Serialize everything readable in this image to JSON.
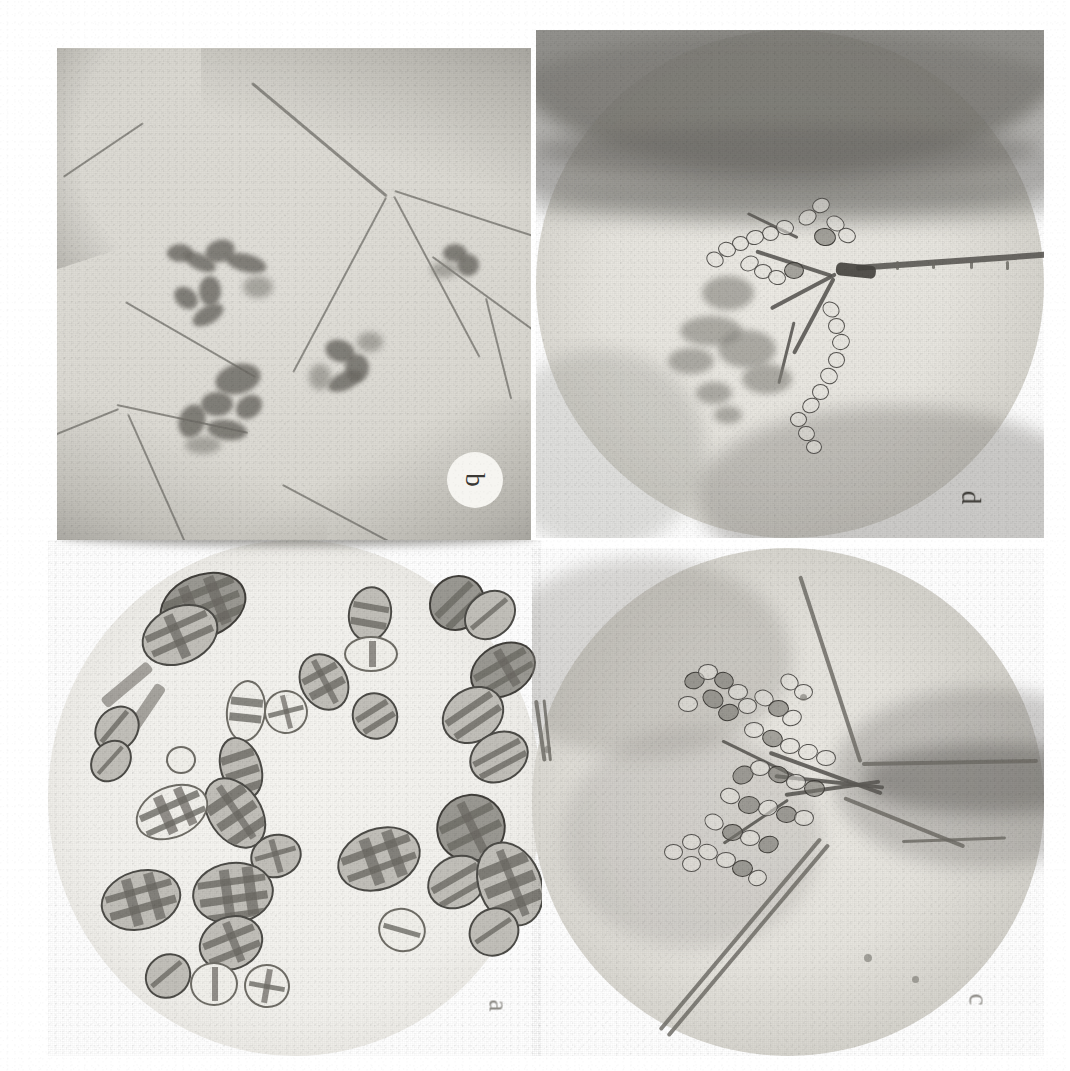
{
  "figure": {
    "background_color": "#ffffff",
    "width": 1070,
    "height": 1071,
    "rendering": "grayscale halftone scan from printed page",
    "label_rotation_degrees": 90,
    "panel_order_on_page": [
      "b",
      "d",
      "a",
      "c"
    ]
  },
  "panels": [
    {
      "id": "panel-b",
      "label": "b",
      "position": "top-left",
      "field_shape": "rectangular crop",
      "subject": "Dark fungal colonies (conidiophore tufts) on the leaf surface with epidermal cell walls and veins visible",
      "label_style": "dark letter inside a white circular disc",
      "dominant_tone": "#dcdad3"
    },
    {
      "id": "panel-d",
      "label": "d",
      "position": "top-right",
      "field_shape": "circular microscope field",
      "subject": "Conidiophore bearing branched acropetal chains of conidia, with out-of-focus dark plant tissue bands across the upper field",
      "label_style": "dark letter on the pale field",
      "dominant_tone": "#e7e5df"
    },
    {
      "id": "panel-a",
      "label": "a",
      "position": "bottom-left",
      "field_shape": "circular microscope field",
      "subject": "Muriform (dictyosporous) conidia with transverse and longitudinal septa, some still attached in short chains on conidiophores",
      "label_style": "faint grey letter on the pale field",
      "dominant_tone": "#f3f2ee"
    },
    {
      "id": "panel-c",
      "label": "c",
      "position": "bottom-right",
      "field_shape": "circular microscope field",
      "subject": "Conidiophore emerging from a hypha on plant tissue, bearing dense branched chains of small conidia",
      "label_style": "faint grey letter on the pale field",
      "dominant_tone": "#e6e4de"
    }
  ],
  "colors": {
    "page": "#ffffff",
    "ink_dark": "#3a3834",
    "ink_faint": "#8d8b86",
    "field_light": "#f3f2ee",
    "field_mid": "#dcdad3",
    "field_dark": "#a6a49d",
    "structure_outline": "#5c5a55"
  }
}
